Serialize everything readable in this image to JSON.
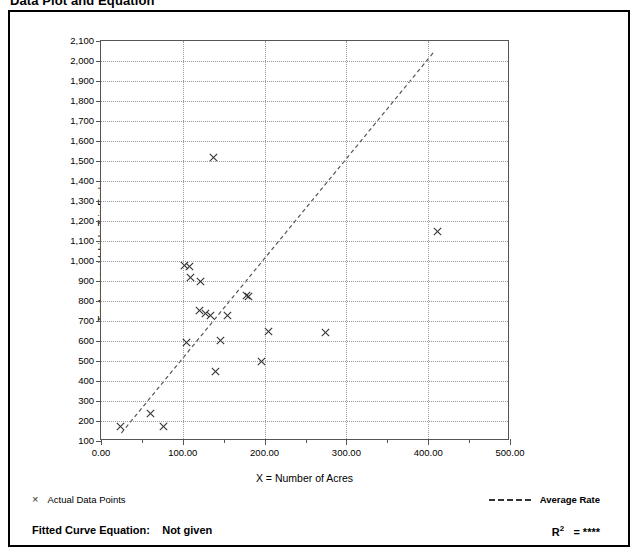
{
  "page_title": "Data Plot and Equation",
  "axes": {
    "x_title": "X = Number of Acres",
    "y_title": "T = Average Vehicle Trip Ends",
    "x_tick_labels": [
      "0.00",
      "100.00",
      "200.00",
      "300.00",
      "400.00",
      "500.00"
    ],
    "y_tick_labels": [
      "100",
      "200",
      "300",
      "400",
      "500",
      "600",
      "700",
      "800",
      "900",
      "1,000",
      "1,100",
      "1,200",
      "1,300",
      "1,400",
      "1,500",
      "1,600",
      "1,700",
      "1,800",
      "1,900",
      "2,000",
      "2,100"
    ]
  },
  "legend": {
    "points_marker": "×",
    "points_label": "Actual Data Points",
    "line_label": "Average Rate"
  },
  "footer": {
    "equation_label": "Fitted Curve Equation:",
    "equation_value": "Not given",
    "r2_label": "R",
    "r2_exponent": "2",
    "r2_value": "= ****"
  },
  "colors": {
    "frame": "#000000",
    "grid": "#9a9a9a",
    "axis": "#555555",
    "marker": "#333333",
    "trend": "#555555",
    "background": "#ffffff"
  },
  "chart_data": {
    "type": "scatter",
    "title": "Data Plot and Equation",
    "xlabel": "X = Number of Acres",
    "ylabel": "T = Average Vehicle Trip Ends",
    "xlim": [
      0,
      500
    ],
    "ylim": [
      100,
      2100
    ],
    "x_major_step": 100,
    "x_minor_step": 50,
    "y_major_step": 100,
    "grid": true,
    "legend_position": "below-plot",
    "series": [
      {
        "name": "Actual Data Points",
        "marker": "x",
        "points": [
          [
            24,
            175
          ],
          [
            61,
            240
          ],
          [
            76,
            175
          ],
          [
            102,
            980
          ],
          [
            108,
            975
          ],
          [
            110,
            920
          ],
          [
            122,
            900
          ],
          [
            104,
            595
          ],
          [
            120,
            755
          ],
          [
            128,
            740
          ],
          [
            134,
            730
          ],
          [
            137,
            1520
          ],
          [
            140,
            450
          ],
          [
            146,
            605
          ],
          [
            155,
            730
          ],
          [
            178,
            830
          ],
          [
            180,
            825
          ],
          [
            196,
            500
          ],
          [
            205,
            650
          ],
          [
            275,
            645
          ],
          [
            411,
            1150
          ]
        ]
      },
      {
        "name": "Average Rate",
        "type": "line",
        "style": "dashed",
        "endpoints": [
          [
            25,
            130
          ],
          [
            410,
            2050
          ]
        ],
        "slope": 4.99,
        "intercept": 5
      }
    ]
  }
}
